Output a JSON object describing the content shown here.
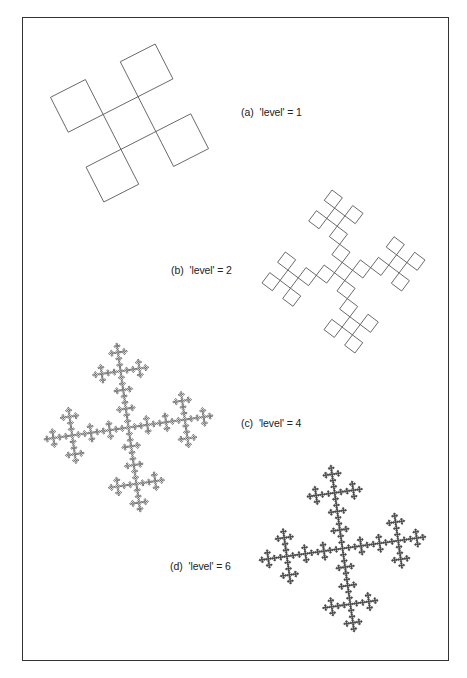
{
  "figure": {
    "frame": {
      "left": 22,
      "top": 17,
      "right": 447,
      "bottom": 659,
      "color": "#333333"
    },
    "curve": {
      "name": "quadratic Koch island",
      "axiom": "F+F+F+F",
      "rule": "F+F-F-F+F",
      "turn_angle_deg": 90,
      "stroke_color": "#444444"
    },
    "panels": [
      {
        "id": "a",
        "tag": "(a)",
        "text": "'level' = 1",
        "level": 1,
        "label_pos": {
          "x": 241,
          "y": 106
        },
        "bbox": {
          "x0": 48,
          "y0": 44,
          "x1": 211,
          "y1": 202
        },
        "rotation_deg": 63,
        "stroke_width": 0.8
      },
      {
        "id": "b",
        "tag": "(b)",
        "text": "'level' = 2",
        "level": 2,
        "label_pos": {
          "x": 171,
          "y": 264
        },
        "bbox": {
          "x0": 262,
          "y0": 190,
          "x1": 425,
          "y1": 353
        },
        "rotation_deg": 37,
        "stroke_width": 0.8
      },
      {
        "id": "c",
        "tag": "(c)",
        "text": "'level' = 4",
        "level": 4,
        "label_pos": {
          "x": 241,
          "y": 417
        },
        "bbox": {
          "x0": 44,
          "y0": 343,
          "x1": 213,
          "y1": 512
        },
        "rotation_deg": 37,
        "stroke_width": 0.7
      },
      {
        "id": "d",
        "tag": "(d)",
        "text": "'level' = 6",
        "level": 6,
        "label_pos": {
          "x": 170,
          "y": 560
        },
        "bbox": {
          "x0": 258,
          "y0": 465,
          "x1": 427,
          "y1": 632
        },
        "rotation_deg": 37,
        "stroke_width": 0.6
      }
    ]
  }
}
